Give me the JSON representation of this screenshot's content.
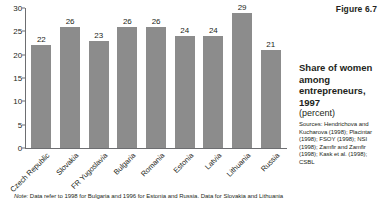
{
  "figure": {
    "number_label": "Figure 6.7",
    "title": "Share of women among entrepreneurs, 1997",
    "subtitle": "(percent)",
    "sources_label": "Sources:",
    "sources_text": "Hendrichova and Kucharova (1998); Placintar (1998); FSOY (1998); NSI (1998); Zamfir and Zamfir (1998); Kask et al. (1998); CSBL",
    "note_label": "Note:",
    "note_text": "Data refer to 1998 for Bulgaria and 1996 for Estonia and Russia. Data for Slovakia and Lithuania"
  },
  "chart_data": {
    "type": "bar",
    "title": "Share of women among entrepreneurs, 1997",
    "subtitle": "(percent)",
    "xlabel": "",
    "ylabel": "",
    "ylim": [
      0,
      30
    ],
    "yticks": [
      0,
      5,
      10,
      15,
      20,
      25,
      30
    ],
    "ytick_labels": [
      "0",
      "5",
      "10",
      "15",
      "20",
      "25",
      "30"
    ],
    "grid": false,
    "legend": null,
    "bar_color": "#8c8c8c",
    "categories": [
      "Czech Republic",
      "Slovakia",
      "FR Yugoslavia",
      "Bulgaria",
      "Romania",
      "Estonia",
      "Latvia",
      "Lithuania",
      "Russia"
    ],
    "values": [
      22,
      26,
      23,
      26,
      26,
      24,
      24,
      29,
      21
    ],
    "value_labels": [
      "22",
      "26",
      "23",
      "26",
      "26",
      "24",
      "24",
      "29",
      "21"
    ]
  }
}
